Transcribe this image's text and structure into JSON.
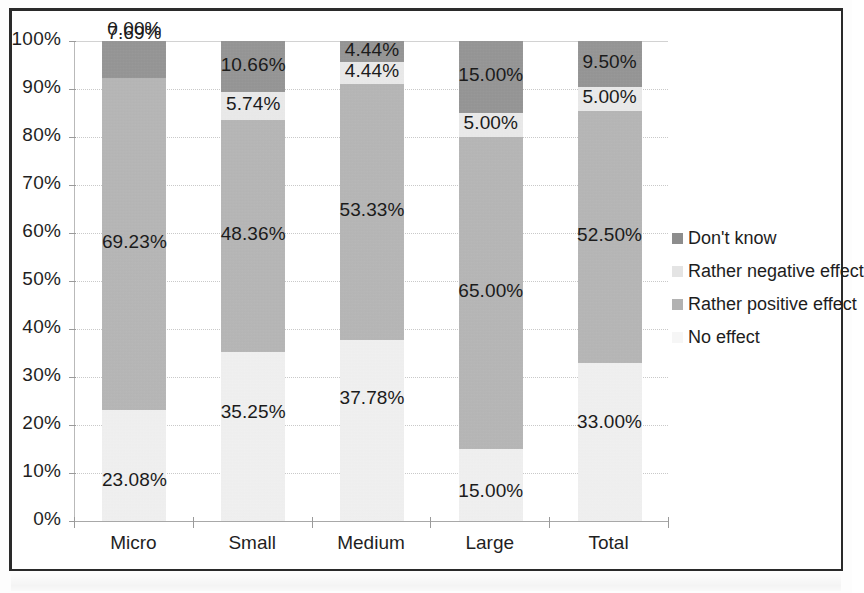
{
  "chart_data": {
    "type": "bar",
    "subtype": "100% stacked column",
    "title": "",
    "xlabel": "",
    "ylabel": "",
    "ylim": [
      0,
      100
    ],
    "ytick_labels": [
      "0%",
      "10%",
      "20%",
      "30%",
      "40%",
      "50%",
      "60%",
      "70%",
      "80%",
      "90%",
      "100%"
    ],
    "ytick_values": [
      0,
      10,
      20,
      30,
      40,
      50,
      60,
      70,
      80,
      90,
      100
    ],
    "grid": true,
    "legend_position": "right",
    "categories": [
      "Micro",
      "Small",
      "Medium",
      "Large",
      "Total"
    ],
    "series": [
      {
        "name": "No effect",
        "color": "#f3f3f3",
        "values": [
          23.08,
          35.25,
          37.78,
          15.0,
          33.0
        ],
        "labels": [
          "23.08%",
          "35.25%",
          "37.78%",
          "15.00%",
          "33.00%"
        ]
      },
      {
        "name": "Rather positive effect",
        "color": "#b2b2b2",
        "values": [
          69.23,
          48.36,
          53.33,
          65.0,
          52.5
        ],
        "labels": [
          "69.23%",
          "48.36%",
          "53.33%",
          "65.00%",
          "52.50%"
        ]
      },
      {
        "name": "Rather negative effect",
        "color": "#ececec",
        "values": [
          0.0,
          5.74,
          4.44,
          5.0,
          5.0
        ],
        "labels": [
          "0.00%",
          "5.74%",
          "4.44%",
          "5.00%",
          "5.00%"
        ]
      },
      {
        "name": "Don't know",
        "color": "#8d8d8d",
        "values": [
          7.69,
          10.66,
          4.44,
          15.0,
          9.5
        ],
        "labels": [
          "7.69%",
          "10.66%",
          "4.44%",
          "15.00%",
          "9.50%"
        ]
      }
    ],
    "legend_entries": [
      {
        "label": "Don't know",
        "color": "#8d8d8d"
      },
      {
        "label": "Rather negative effect",
        "color": "#e4e4e4"
      },
      {
        "label": "Rather positive effect",
        "color": "#b2b2b2"
      },
      {
        "label": "No effect",
        "color": "#f6f6f6"
      }
    ]
  },
  "axes": {
    "y_ticks": [
      {
        "label": "100%"
      },
      {
        "label": "90%"
      },
      {
        "label": "80%"
      },
      {
        "label": "70%"
      },
      {
        "label": "60%"
      },
      {
        "label": "50%"
      },
      {
        "label": "40%"
      },
      {
        "label": "30%"
      },
      {
        "label": "20%"
      },
      {
        "label": "10%"
      },
      {
        "label": "0%"
      }
    ],
    "x_categories": [
      {
        "label": "Micro"
      },
      {
        "label": "Small"
      },
      {
        "label": "Medium"
      },
      {
        "label": "Large"
      },
      {
        "label": "Total"
      }
    ]
  }
}
